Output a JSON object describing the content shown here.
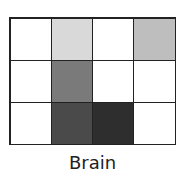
{
  "label": "Brain",
  "grid": {
    "rows": 3,
    "cols": 4,
    "cells": [
      [
        "#ffffff",
        "#d9d9d9",
        "#ffffff",
        "#bebebe"
      ],
      [
        "#ffffff",
        "#7a7a7a",
        "#ffffff",
        "#ffffff"
      ],
      [
        "#ffffff",
        "#4a4a4a",
        "#2e2e2e",
        "#ffffff"
      ]
    ]
  }
}
